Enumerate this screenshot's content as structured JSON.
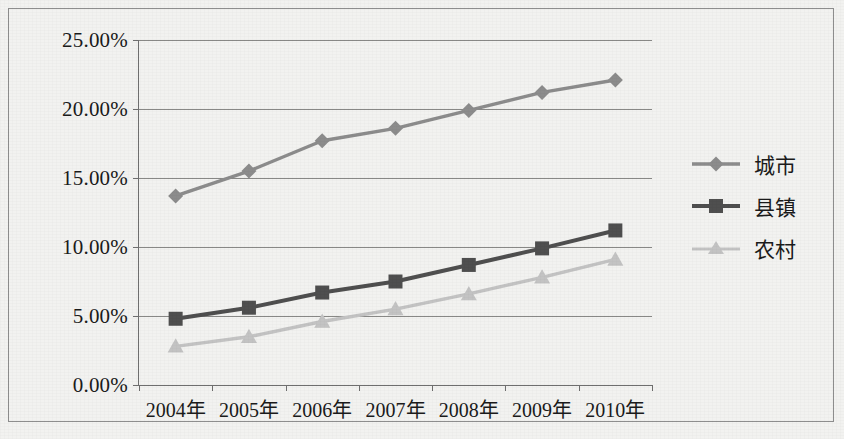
{
  "chart_data": {
    "type": "line",
    "title": "",
    "subtitle": "",
    "xlabel": "",
    "ylabel": "",
    "categories": [
      "2004年",
      "2005年",
      "2006年",
      "2007年",
      "2008年",
      "2009年",
      "2010年"
    ],
    "ylim": [
      0,
      25
    ],
    "ytick_values": [
      0,
      5,
      10,
      15,
      20,
      25
    ],
    "ytick_labels": [
      "0.00%",
      "5.00%",
      "10.00%",
      "15.00%",
      "20.00%",
      "25.00%"
    ],
    "grid": true,
    "grid_axis": "y",
    "legend_position": "right",
    "series": [
      {
        "name": "城市",
        "marker": "diamond",
        "color": "#8c8c8c",
        "values": [
          13.7,
          15.5,
          17.7,
          18.6,
          19.9,
          21.2,
          22.1
        ]
      },
      {
        "name": "县镇",
        "marker": "square",
        "color": "#4f4f4f",
        "values": [
          4.8,
          5.6,
          6.7,
          7.5,
          8.7,
          9.9,
          11.2
        ]
      },
      {
        "name": "农村",
        "marker": "triangle",
        "color": "#c3c3c3",
        "values": [
          2.8,
          3.5,
          4.6,
          5.5,
          6.6,
          7.8,
          9.1
        ]
      }
    ]
  },
  "legend": {
    "items": [
      {
        "label": "城市"
      },
      {
        "label": "县镇"
      },
      {
        "label": "农村"
      }
    ]
  },
  "colors": {
    "series_city": "#8c8c8c",
    "series_county": "#4f4f4f",
    "series_rural": "#c3c3c3",
    "gridline": "#888886",
    "axis": "#6f6f6f",
    "text": "#1b1b1b",
    "background": "#f2f2f0"
  }
}
